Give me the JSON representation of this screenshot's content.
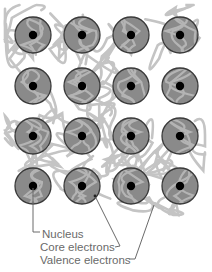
{
  "diagram": {
    "grid": {
      "rows": 4,
      "cols": 4
    },
    "colors": {
      "atom_fill": "#8a8a8a",
      "atom_stroke": "#3a3a3a",
      "nucleus": "#000000",
      "electron_cloud": "#c4c4c4",
      "core_electron": "#b4b4b4",
      "label_text": "#6a6a6a",
      "leader_line": "#6a6a6a"
    },
    "labels": [
      {
        "id": "nucleus",
        "text": "Nucleus"
      },
      {
        "id": "core",
        "text": "Core electrons"
      },
      {
        "id": "valence",
        "text": "Valence electrons"
      }
    ]
  }
}
